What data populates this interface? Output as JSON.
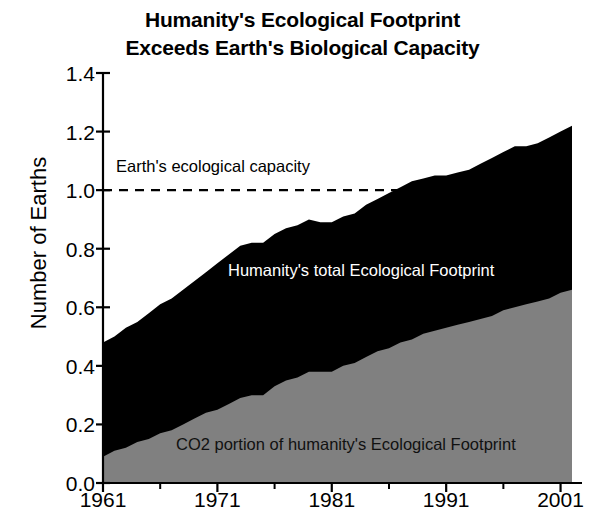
{
  "chart_data": {
    "type": "area",
    "title": "Humanity's Ecological Footprint Exceeds Earth's Biological Capacity",
    "title_lines": [
      "Humanity's Ecological Footprint",
      "Exceeds Earth's Biological Capacity"
    ],
    "xlabel": "",
    "ylabel": "Number of Earths",
    "stacked": true,
    "grid": false,
    "legend_position": "in-plot annotations",
    "xlim": [
      1961,
      2002
    ],
    "ylim": [
      0.0,
      1.4
    ],
    "ytick_labels": [
      "0.0",
      "0.2",
      "0.4",
      "0.6",
      "0.8",
      "1.0",
      "1.2",
      "1.4"
    ],
    "ytick_values": [
      0.0,
      0.2,
      0.4,
      0.6,
      0.8,
      1.0,
      1.2,
      1.4
    ],
    "xtick_labels": [
      "1961",
      "1971",
      "1981",
      "1991",
      "2001"
    ],
    "xtick_values": [
      1961,
      1971,
      1981,
      1991,
      2001
    ],
    "xminor_ticks": [
      1966,
      1976,
      1986,
      1996
    ],
    "x": [
      1961,
      1962,
      1963,
      1964,
      1965,
      1966,
      1967,
      1968,
      1969,
      1970,
      1971,
      1972,
      1973,
      1974,
      1975,
      1976,
      1977,
      1978,
      1979,
      1980,
      1981,
      1982,
      1983,
      1984,
      1985,
      1986,
      1987,
      1988,
      1989,
      1990,
      1991,
      1992,
      1993,
      1994,
      1995,
      1996,
      1997,
      1998,
      1999,
      2000,
      2001,
      2002
    ],
    "series": [
      {
        "name": "Humanity's total Ecological Footprint",
        "color": "#000000",
        "values": [
          0.48,
          0.5,
          0.53,
          0.55,
          0.58,
          0.61,
          0.63,
          0.66,
          0.69,
          0.72,
          0.75,
          0.78,
          0.81,
          0.82,
          0.82,
          0.85,
          0.87,
          0.88,
          0.9,
          0.89,
          0.89,
          0.91,
          0.92,
          0.95,
          0.97,
          0.99,
          1.01,
          1.03,
          1.04,
          1.05,
          1.05,
          1.06,
          1.07,
          1.09,
          1.11,
          1.13,
          1.15,
          1.15,
          1.16,
          1.18,
          1.2,
          1.22
        ]
      },
      {
        "name": "CO2 portion of humanity's Ecological Footprint",
        "color": "#808080",
        "values": [
          0.09,
          0.11,
          0.12,
          0.14,
          0.15,
          0.17,
          0.18,
          0.2,
          0.22,
          0.24,
          0.25,
          0.27,
          0.29,
          0.3,
          0.3,
          0.33,
          0.35,
          0.36,
          0.38,
          0.38,
          0.38,
          0.4,
          0.41,
          0.43,
          0.45,
          0.46,
          0.48,
          0.49,
          0.51,
          0.52,
          0.53,
          0.54,
          0.55,
          0.56,
          0.57,
          0.59,
          0.6,
          0.61,
          0.62,
          0.63,
          0.65,
          0.66
        ]
      }
    ],
    "reference_line": {
      "label": "Earth's ecological capacity",
      "value": 1.0,
      "style": "dashed",
      "color": "#000000"
    },
    "annotations": [
      {
        "name": "capacity-label",
        "text": "Earth's ecological capacity"
      },
      {
        "name": "total-footprint-label",
        "text": "Humanity's total Ecological Footprint"
      },
      {
        "name": "co2-label",
        "text": "CO2 portion of humanity's Ecological Footprint"
      }
    ]
  }
}
